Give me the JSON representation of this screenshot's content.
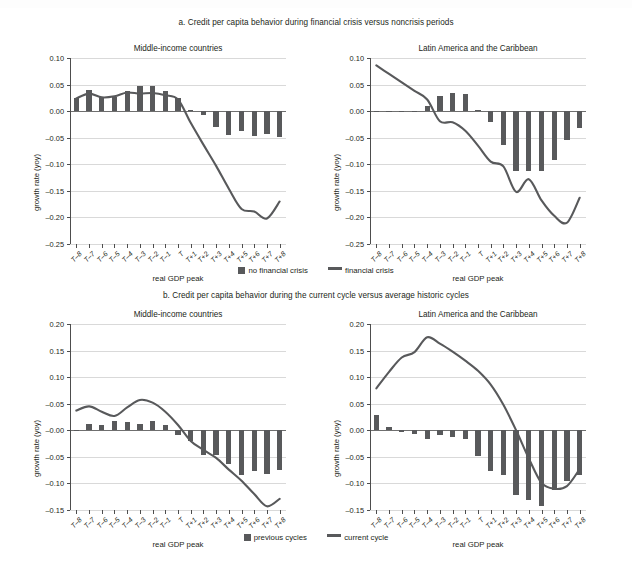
{
  "figure": {
    "sections": [
      {
        "id": "a",
        "title": "a. Credit per capita behavior during financial crisis versus noncrisis periods"
      },
      {
        "id": "b",
        "title": "b. Credit per capita behavior during the current cycle versus average historic cycles"
      }
    ],
    "legends": [
      {
        "id": "legend-a",
        "items": [
          {
            "marker": "bar-swatch-icon",
            "label": "no financial crisis"
          },
          {
            "marker": "line-swatch-icon",
            "label": "financial crisis"
          }
        ]
      },
      {
        "id": "legend-b",
        "items": [
          {
            "marker": "bar-swatch-icon",
            "label": "previous cycles"
          },
          {
            "marker": "line-swatch-icon",
            "label": "current cycle"
          }
        ]
      }
    ],
    "colors": {
      "bar": "#58595b",
      "line": "#58595b",
      "grid": "#d9d9d9",
      "axis": "#4d4d4d",
      "text": "#231f20",
      "background": "#ffffff"
    }
  },
  "chart_data": [
    {
      "type": "bar",
      "panel_id": "a-left",
      "title": "Middle-income countries",
      "xlabel": "real GDP peak",
      "ylabel": "growth rate (yoy)",
      "ylim": [
        -0.25,
        0.1
      ],
      "yticks": [
        0.1,
        0.05,
        0.0,
        -0.05,
        -0.1,
        -0.15,
        -0.2,
        -0.25
      ],
      "ytick_labels": [
        "0.10",
        "0.05",
        "0.00",
        "–0.05",
        "–0.10",
        "–0.15",
        "–0.20",
        "–0.25"
      ],
      "grid": true,
      "legend_position": "below-figure",
      "categories": [
        "T–8",
        "T–7",
        "T–6",
        "T–5",
        "T–4",
        "T–3",
        "T–2",
        "T–1",
        "T",
        "T+1",
        "T+2",
        "T+3",
        "T+4",
        "T+5",
        "T+6",
        "T+7",
        "T+8"
      ],
      "series": [
        {
          "name": "no financial crisis",
          "type": "bar",
          "values": [
            0.025,
            0.04,
            0.026,
            0.027,
            0.037,
            0.047,
            0.047,
            0.037,
            0.024,
            0.002,
            -0.008,
            -0.03,
            -0.044,
            -0.037,
            -0.047,
            -0.043,
            -0.049
          ]
        },
        {
          "name": "financial crisis",
          "type": "line",
          "values": [
            0.024,
            0.033,
            0.026,
            0.028,
            0.035,
            0.033,
            0.034,
            0.03,
            0.022,
            -0.022,
            -0.063,
            -0.103,
            -0.146,
            -0.184,
            -0.189,
            -0.202,
            -0.17
          ]
        }
      ]
    },
    {
      "type": "bar",
      "panel_id": "a-right",
      "title": "Latin America and the Caribbean",
      "xlabel": "real GDP peak",
      "ylabel": "growth rate (yoy)",
      "ylim": [
        -0.25,
        0.1
      ],
      "yticks": [
        0.1,
        0.05,
        0.0,
        -0.05,
        -0.1,
        -0.15,
        -0.2,
        -0.25
      ],
      "ytick_labels": [
        "0.10",
        "0.05",
        "0.00",
        "–0.05",
        "–0.10",
        "–0.15",
        "–0.20",
        "–0.25"
      ],
      "grid": true,
      "legend_position": "below-figure",
      "categories": [
        "T–8",
        "T–7",
        "T–6",
        "T–5",
        "T–4",
        "T–3",
        "T–2",
        "T–1",
        "T",
        "T+1",
        "T+2",
        "T+3",
        "T+4",
        "T+5",
        "T+6",
        "T+7",
        "T+8"
      ],
      "series": [
        {
          "name": "no financial crisis",
          "type": "bar",
          "values": [
            0.001,
            -0.001,
            0.0,
            0.001,
            0.01,
            0.029,
            0.035,
            0.033,
            0.002,
            -0.021,
            -0.063,
            -0.113,
            -0.113,
            -0.112,
            -0.092,
            -0.055,
            -0.031
          ]
        },
        {
          "name": "financial crisis",
          "type": "line",
          "values": [
            0.086,
            0.07,
            0.054,
            0.038,
            0.022,
            -0.019,
            -0.021,
            -0.037,
            -0.065,
            -0.095,
            -0.104,
            -0.152,
            -0.128,
            -0.168,
            -0.197,
            -0.21,
            -0.163
          ]
        }
      ]
    },
    {
      "type": "bar",
      "panel_id": "b-left",
      "title": "Middle-income countries",
      "xlabel": "real GDP peak",
      "ylabel": "growth rate (yoy)",
      "ylim": [
        -0.15,
        0.2
      ],
      "yticks": [
        0.2,
        0.15,
        0.1,
        0.05,
        0.0,
        -0.05,
        -0.1,
        -0.15
      ],
      "ytick_labels": [
        "0.20",
        "0.15",
        "0.10",
        "–0.05",
        "–0.00",
        "–0.05",
        "–0.10",
        "–0.15"
      ],
      "grid": true,
      "legend_position": "below-figure",
      "categories": [
        "T–8",
        "T–7",
        "T–6",
        "T–5",
        "T–4",
        "T–3",
        "T–2",
        "T–1",
        "T",
        "T+1",
        "T+2",
        "T+3",
        "T+4",
        "T+5",
        "T+6",
        "T+7",
        "T+8"
      ],
      "series": [
        {
          "name": "previous cycles",
          "type": "bar",
          "values": [
            -0.002,
            0.011,
            0.01,
            0.017,
            0.016,
            0.012,
            0.017,
            0.01,
            -0.009,
            -0.021,
            -0.046,
            -0.047,
            -0.064,
            -0.085,
            -0.076,
            -0.083,
            -0.075
          ]
        },
        {
          "name": "current cycle",
          "type": "line",
          "values": [
            0.037,
            0.045,
            0.035,
            0.027,
            0.043,
            0.057,
            0.052,
            0.035,
            0.01,
            -0.02,
            -0.037,
            -0.052,
            -0.074,
            -0.095,
            -0.12,
            -0.143,
            -0.129
          ]
        }
      ]
    },
    {
      "type": "bar",
      "panel_id": "b-right",
      "title": "Latin America and the Caribbean",
      "xlabel": "real GDP peak",
      "ylabel": "growth rate (yoy)",
      "ylim": [
        -0.15,
        0.2
      ],
      "yticks": [
        0.2,
        0.15,
        0.1,
        0.05,
        0.0,
        -0.05,
        -0.1,
        -0.15
      ],
      "ytick_labels": [
        "0.20",
        "0.15",
        "0.10",
        "0.05",
        "0.00",
        "–0.05",
        "–0.10",
        "–0.15"
      ],
      "grid": true,
      "legend_position": "below-figure",
      "categories": [
        "T–8",
        "T–7",
        "T–6",
        "T–5",
        "T–4",
        "T–3",
        "T–2",
        "T–1",
        "T",
        "T+1",
        "T+2",
        "T+3",
        "T+4",
        "T+5",
        "T+6",
        "T+7",
        "T+8"
      ],
      "series": [
        {
          "name": "previous cycles",
          "type": "bar",
          "values": [
            0.028,
            0.007,
            -0.003,
            -0.007,
            -0.016,
            -0.009,
            -0.013,
            -0.016,
            -0.048,
            -0.077,
            -0.084,
            -0.122,
            -0.132,
            -0.142,
            -0.112,
            -0.095,
            -0.084
          ]
        },
        {
          "name": "current cycle",
          "type": "line",
          "values": [
            0.079,
            0.11,
            0.137,
            0.147,
            0.175,
            0.163,
            0.148,
            0.131,
            0.112,
            0.086,
            0.048,
            0.0,
            -0.053,
            -0.099,
            -0.11,
            -0.105,
            -0.073
          ]
        }
      ]
    }
  ]
}
